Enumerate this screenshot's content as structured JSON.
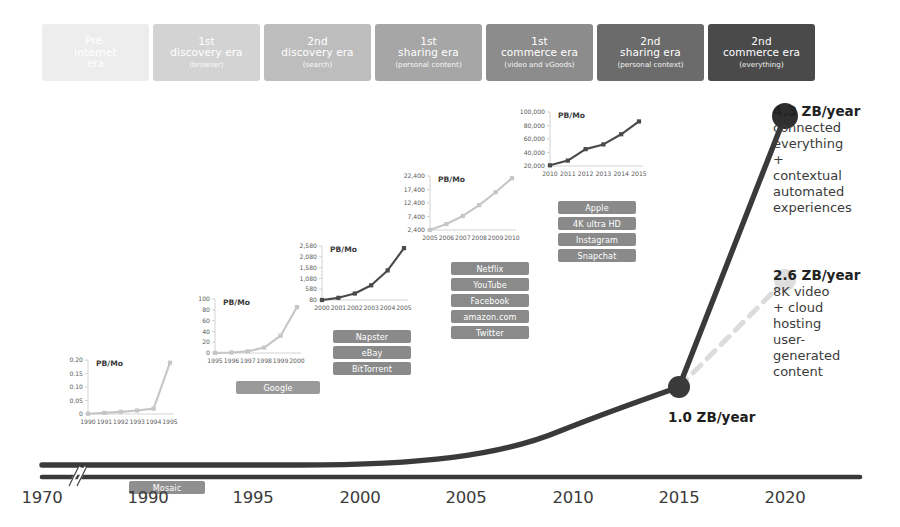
{
  "eras": [
    {
      "title": "Pre-\ninternet\nera",
      "sub": "",
      "color": "#ededed",
      "x": 42
    },
    {
      "title": "1st\ndiscovery era",
      "sub": "(browser)",
      "color": "#d3d3d3",
      "x": 153
    },
    {
      "title": "2nd\ndiscovery era",
      "sub": "(search)",
      "color": "#bdbdbd",
      "x": 264
    },
    {
      "title": "1st\nsharing era",
      "sub": "(personal content)",
      "color": "#a6a6a6",
      "x": 375
    },
    {
      "title": "1st\ncommerce era",
      "sub": "(video and vGoods)",
      "color": "#8c8c8c",
      "x": 486
    },
    {
      "title": "2nd\nsharing era",
      "sub": "(personal context)",
      "color": "#6b6b6b",
      "x": 597
    },
    {
      "title": "2nd\ncommerce era",
      "sub": "(everything)",
      "color": "#4a4a4a",
      "x": 708
    }
  ],
  "axis": {
    "years": [
      "1970",
      "1990",
      "1995",
      "2000",
      "2005",
      "2010",
      "2015",
      "2020"
    ],
    "positions": [
      42,
      148,
      253,
      360,
      466,
      573,
      679,
      785
    ],
    "break_mark": true
  },
  "annotations": [
    {
      "name": "endpoint-2020",
      "head": "4.3 ZB/year",
      "body": "connected\neverything\n+\ncontextual\nautomated\nexperiences",
      "color": "#3a3a3a"
    },
    {
      "name": "endpoint-dashed-2020",
      "head": "2.6 ZB/year",
      "body": "8K video\n+ cloud\nhosting\nuser-\ngenerated\ncontent",
      "color": "#d8d8d8"
    }
  ],
  "node_labels": [
    {
      "name": "node-2015",
      "text": "1.0 ZB/year"
    }
  ],
  "unit_label": "PB/Mo",
  "tag_groups": [
    {
      "name": "mosaic-tags",
      "x": 129,
      "y": 481,
      "width": 76,
      "items": [
        "Mosaic"
      ],
      "color": "#8f8f8f"
    },
    {
      "name": "google-tags",
      "x": 236,
      "y": 381,
      "width": 84,
      "items": [
        "Google"
      ],
      "color": "#9a9a9a"
    },
    {
      "name": "napster-tags",
      "x": 333,
      "y": 330,
      "width": 78,
      "items": [
        "Napster",
        "eBay",
        "BitTorrent"
      ],
      "color": "#8a8a8a"
    },
    {
      "name": "netflix-tags",
      "x": 451,
      "y": 262,
      "width": 78,
      "items": [
        "Netflix",
        "YouTube",
        "Facebook",
        "amazon.com",
        "Twitter"
      ],
      "color": "#8a8a8a"
    },
    {
      "name": "apple-tags",
      "x": 558,
      "y": 201,
      "width": 78,
      "items": [
        "Apple",
        "4K ultra HD",
        "Instagram",
        "Snapchat"
      ],
      "color": "#8a8a8a"
    }
  ],
  "chart_data": [
    {
      "type": "line",
      "name": "main-curve",
      "title": "Global IP traffic growth",
      "xlabel": "",
      "ylabel": "ZB/year",
      "x": [
        1970,
        1990,
        1995,
        2000,
        2005,
        2010,
        2012,
        2015,
        2020
      ],
      "values": [
        0,
        0,
        0.002,
        0.01,
        0.04,
        0.12,
        0.22,
        1.0,
        4.3
      ],
      "annotated_points": [
        {
          "x": 2015,
          "y": 1.0,
          "label": "1.0 ZB/year"
        },
        {
          "x": 2020,
          "y": 4.3,
          "label": "4.3 ZB/year"
        }
      ],
      "forecast_branch": {
        "style": "dashed",
        "x": [
          2015,
          2020
        ],
        "values": [
          1.0,
          2.6
        ],
        "label": "2.6 ZB/year"
      },
      "grid": false,
      "legend": "none"
    },
    {
      "type": "line",
      "name": "inset-1990-1995",
      "ylabel": "PB/Mo",
      "categories": [
        "1990",
        "1991",
        "1992",
        "1993",
        "1994",
        "1995"
      ],
      "values": [
        0.001,
        0.004,
        0.008,
        0.013,
        0.02,
        0.19
      ],
      "yticks": [
        "0",
        "0.05",
        "0.10",
        "0.15",
        "0.20"
      ],
      "ylim": [
        0,
        0.2
      ]
    },
    {
      "type": "line",
      "name": "inset-1995-2000",
      "ylabel": "PB/Mo",
      "categories": [
        "1995",
        "1996",
        "1997",
        "1998",
        "1999",
        "2000"
      ],
      "values": [
        0.2,
        1,
        3,
        10,
        32,
        85
      ],
      "yticks": [
        "0",
        "20",
        "40",
        "60",
        "80",
        "100"
      ],
      "ylim": [
        0,
        100
      ]
    },
    {
      "type": "line",
      "name": "inset-2000-2005",
      "ylabel": "PB/Mo",
      "categories": [
        "2000",
        "2001",
        "2002",
        "2003",
        "2004",
        "2005"
      ],
      "values": [
        80,
        180,
        380,
        760,
        1450,
        2480
      ],
      "yticks": [
        "80",
        "580",
        "1,080",
        "1,580",
        "2,080",
        "2,580"
      ],
      "ylim": [
        80,
        2580
      ]
    },
    {
      "type": "line",
      "name": "inset-2005-2010",
      "ylabel": "PB/Mo",
      "categories": [
        "2005",
        "2006",
        "2007",
        "2008",
        "2009",
        "2010"
      ],
      "values": [
        2400,
        4600,
        7600,
        11600,
        16400,
        21600
      ],
      "yticks": [
        "2,400",
        "7,400",
        "12,400",
        "17,400",
        "22,400"
      ],
      "ylim": [
        2400,
        22400
      ]
    },
    {
      "type": "line",
      "name": "inset-2010-2015",
      "ylabel": "PB/Mo",
      "categories": [
        "2010",
        "2011",
        "2012",
        "2013",
        "2014",
        "2015"
      ],
      "values": [
        21000,
        28000,
        45000,
        52000,
        67000,
        86000
      ],
      "yticks": [
        "20,000",
        "40,000",
        "60,000",
        "80,000",
        "100,000"
      ],
      "ylim": [
        20000,
        100000
      ]
    }
  ]
}
